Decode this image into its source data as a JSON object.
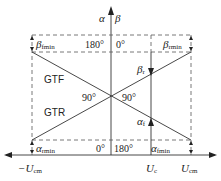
{
  "diagram": {
    "axes": {
      "vertical_left_label": "α",
      "vertical_right_label": "β"
    },
    "regions": {
      "upper": "GTF",
      "lower": "GTR"
    },
    "angles": {
      "top_left": "180°",
      "top_right": "0°",
      "mid_left": "90°",
      "mid_right": "90°",
      "bottom_left": "0°",
      "bottom_right": "180°"
    },
    "limits": {
      "beta_fmin": {
        "main": "β",
        "sub": "fmin"
      },
      "beta_rmin": {
        "main": "β",
        "sub": "rmin"
      },
      "beta_r": {
        "main": "β",
        "sub": "r"
      },
      "alpha_f": {
        "main": "α",
        "sub": "f"
      },
      "alpha_rmin": {
        "main": "α",
        "sub": "rmin"
      },
      "alpha_fmin": {
        "main": "α",
        "sub": "fmin"
      }
    },
    "x_labels": {
      "neg_ucm": {
        "main": "−U",
        "sub": "cm"
      },
      "uc": {
        "main": "U",
        "sub": "c"
      },
      "ucm": {
        "main": "U",
        "sub": "cm"
      }
    },
    "colors": {
      "line": "#333333",
      "dashed": "#555555"
    }
  }
}
